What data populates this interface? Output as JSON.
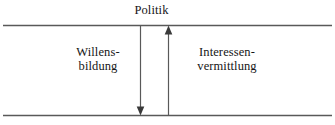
{
  "diagram": {
    "title": "Politik",
    "left_label": {
      "line1": "Willens-",
      "line2": "bildung"
    },
    "right_label": {
      "line1": "Interessen-",
      "line2": "vermittlung"
    },
    "arrows": [
      {
        "name": "willensbildung-arrow",
        "direction": "down"
      },
      {
        "name": "interessenvermittlung-arrow",
        "direction": "up"
      }
    ],
    "colors": {
      "line": "#595959",
      "text": "#161616",
      "background": "#ffffff"
    }
  }
}
